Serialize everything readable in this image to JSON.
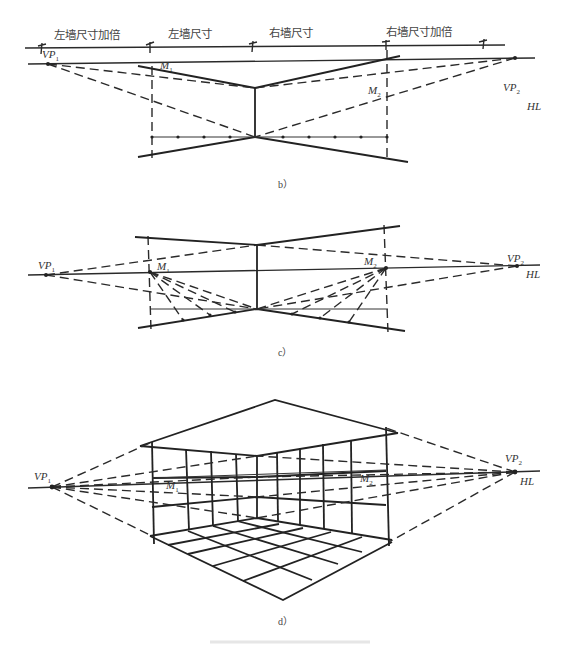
{
  "figure": {
    "panels": [
      {
        "id": "b",
        "caption": "b）",
        "dimension_labels": [
          "左墙尺寸加倍",
          "左墙尺寸",
          "右墙尺寸",
          "右墙尺寸加倍"
        ],
        "points": {
          "vp1": "VP",
          "vp1_sub": "1",
          "vp2": "VP",
          "vp2_sub": "2",
          "m1": "M",
          "m1_sub": "1",
          "m2": "M",
          "m2_sub": "2",
          "hl": "HL"
        }
      },
      {
        "id": "c",
        "caption": "c）",
        "points": {
          "vp1": "VP",
          "vp1_sub": "1",
          "vp2": "VP",
          "vp2_sub": "2",
          "m1": "M",
          "m1_sub": "1",
          "m2": "M",
          "m2_sub": "2",
          "hl": "HL"
        }
      },
      {
        "id": "d",
        "caption": "d）",
        "points": {
          "vp1": "VP",
          "vp1_sub": "1",
          "vp2": "VP",
          "vp2_sub": "2",
          "m1": "M",
          "m1_sub": "1",
          "m2": "M",
          "m2_sub": "2",
          "hl": "HL"
        }
      }
    ]
  }
}
